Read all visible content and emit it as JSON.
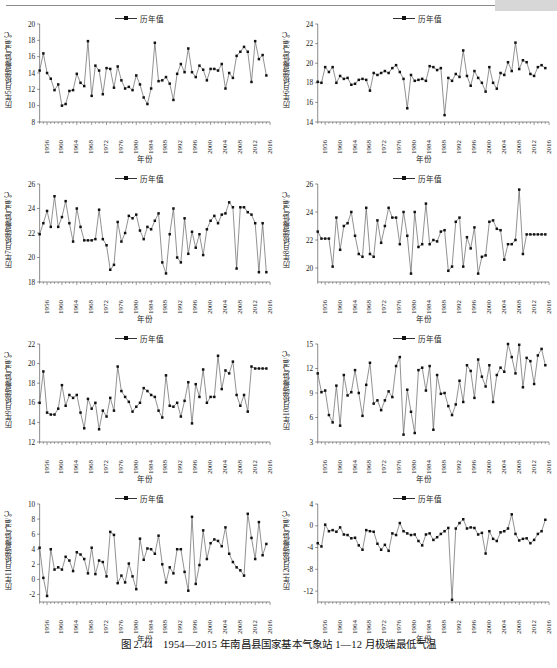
{
  "figure": {
    "caption": "图 2.44　1954—2015 年南昌县国家基本气象站 1—12 月极端最低气温",
    "legend_label": "历年值",
    "xaxis_title": "年份",
    "marker_color": "#111111",
    "line_color": "#555555"
  },
  "xticks": [
    "1956",
    "1960",
    "1964",
    "1968",
    "1972",
    "1976",
    "1980",
    "1984",
    "1988",
    "1992",
    "1996",
    "2000",
    "2004",
    "2008",
    "2012",
    "2016"
  ],
  "chart_data": [
    {
      "type": "line",
      "panel": 1,
      "title": "",
      "ylabel": "历年5月极端最低气温/℃",
      "xlabel": "年份",
      "series_name": "历年值",
      "ylim": [
        8,
        20
      ],
      "yticks": [
        8,
        10,
        12,
        14,
        16,
        18,
        20
      ],
      "grid": false,
      "legend_position": "top-center",
      "x": [
        1954,
        1955,
        1956,
        1957,
        1958,
        1959,
        1960,
        1961,
        1962,
        1963,
        1964,
        1965,
        1966,
        1967,
        1968,
        1969,
        1970,
        1971,
        1972,
        1973,
        1974,
        1975,
        1976,
        1977,
        1978,
        1979,
        1980,
        1981,
        1982,
        1983,
        1984,
        1985,
        1986,
        1987,
        1988,
        1989,
        1990,
        1991,
        1992,
        1993,
        1994,
        1995,
        1996,
        1997,
        1998,
        1999,
        2000,
        2001,
        2002,
        2003,
        2004,
        2005,
        2006,
        2007,
        2008,
        2009,
        2010,
        2011,
        2012,
        2013,
        2014,
        2015
      ],
      "values": [
        14.3,
        16.4,
        14.0,
        13.3,
        11.9,
        12.6,
        10.0,
        10.2,
        11.8,
        11.9,
        13.9,
        12.8,
        12.4,
        17.9,
        11.2,
        14.9,
        14.3,
        11.4,
        14.6,
        14.5,
        12.2,
        14.8,
        13.1,
        12.1,
        12.3,
        11.9,
        13.7,
        12.6,
        11.0,
        10.2,
        12.1,
        17.7,
        13.0,
        13.1,
        13.5,
        12.7,
        10.7,
        13.9,
        15.1,
        14.1,
        17.0,
        14.1,
        13.5,
        14.9,
        14.4,
        13.1,
        14.5,
        14.5,
        14.3,
        15.1,
        12.1,
        14.0,
        13.4,
        16.1,
        16.6,
        17.2,
        16.6,
        12.9,
        17.9,
        15.7,
        16.2,
        13.7
      ]
    },
    {
      "type": "line",
      "panel": 2,
      "title": "",
      "ylabel": "历年6月极端最低气温/℃",
      "xlabel": "年份",
      "series_name": "历年值",
      "ylim": [
        14,
        24
      ],
      "yticks": [
        14,
        16,
        18,
        20,
        22,
        24
      ],
      "grid": false,
      "legend_position": "top-center",
      "x": [
        1954,
        1955,
        1956,
        1957,
        1958,
        1959,
        1960,
        1961,
        1962,
        1963,
        1964,
        1965,
        1966,
        1967,
        1968,
        1969,
        1970,
        1971,
        1972,
        1973,
        1974,
        1975,
        1976,
        1977,
        1978,
        1979,
        1980,
        1981,
        1982,
        1983,
        1984,
        1985,
        1986,
        1987,
        1988,
        1989,
        1990,
        1991,
        1992,
        1993,
        1994,
        1995,
        1996,
        1997,
        1998,
        1999,
        2000,
        2001,
        2002,
        2003,
        2004,
        2005,
        2006,
        2007,
        2008,
        2009,
        2010,
        2011,
        2012,
        2013,
        2014,
        2015
      ],
      "values": [
        18.1,
        18.0,
        19.6,
        19.1,
        19.6,
        18.0,
        18.7,
        18.4,
        18.5,
        17.8,
        17.9,
        18.3,
        18.4,
        18.3,
        17.2,
        19.0,
        18.8,
        19.0,
        19.2,
        19.0,
        19.5,
        19.8,
        19.1,
        18.4,
        15.4,
        18.8,
        18.2,
        18.3,
        18.4,
        18.2,
        19.7,
        19.6,
        19.3,
        19.5,
        14.7,
        18.5,
        18.2,
        18.9,
        18.6,
        21.3,
        18.7,
        17.7,
        19.2,
        18.5,
        18.0,
        17.1,
        19.6,
        18.0,
        17.4,
        19.0,
        18.8,
        20.1,
        19.2,
        22.1,
        19.4,
        20.3,
        20.1,
        18.9,
        18.7,
        19.6,
        19.8,
        19.5
      ]
    },
    {
      "type": "line",
      "panel": 3,
      "title": "",
      "ylabel": "历年7月极端最低气温/℃",
      "xlabel": "年份",
      "series_name": "历年值",
      "ylim": [
        18,
        26
      ],
      "yticks": [
        18,
        20,
        22,
        24,
        26
      ],
      "grid": false,
      "legend_position": "top-center",
      "x": [
        1954,
        1955,
        1956,
        1957,
        1958,
        1959,
        1960,
        1961,
        1962,
        1963,
        1964,
        1965,
        1966,
        1967,
        1968,
        1969,
        1970,
        1971,
        1972,
        1973,
        1974,
        1975,
        1976,
        1977,
        1978,
        1979,
        1980,
        1981,
        1982,
        1983,
        1984,
        1985,
        1986,
        1987,
        1988,
        1989,
        1990,
        1991,
        1992,
        1993,
        1994,
        1995,
        1996,
        1997,
        1998,
        1999,
        2000,
        2001,
        2002,
        2003,
        2004,
        2005,
        2006,
        2007,
        2008,
        2009,
        2010,
        2011,
        2012,
        2013,
        2014,
        2015
      ],
      "values": [
        21.9,
        22.8,
        23.8,
        22.5,
        25.0,
        22.5,
        23.3,
        24.6,
        22.8,
        21.3,
        24.0,
        22.5,
        21.4,
        21.4,
        21.4,
        21.5,
        23.9,
        21.5,
        21.0,
        19.0,
        19.4,
        22.9,
        21.3,
        22.0,
        23.4,
        23.2,
        23.5,
        22.2,
        21.5,
        22.5,
        22.3,
        23.0,
        23.6,
        19.6,
        18.7,
        21.9,
        24.0,
        20.0,
        19.6,
        23.2,
        20.3,
        22.1,
        20.8,
        21.9,
        20.2,
        22.3,
        23.0,
        23.4,
        22.8,
        23.5,
        23.6,
        24.5,
        24.1,
        19.1,
        24.1,
        24.1,
        23.7,
        23.5,
        22.8,
        18.8,
        22.8,
        18.8
      ]
    },
    {
      "type": "line",
      "panel": 4,
      "title": "",
      "ylabel": "历年8月极端最低气温/℃",
      "xlabel": "年份",
      "series_name": "历年值",
      "ylim": [
        19,
        26
      ],
      "yticks": [
        20,
        22,
        24,
        26
      ],
      "grid": false,
      "legend_position": "top-center",
      "x": [
        1954,
        1955,
        1956,
        1957,
        1958,
        1959,
        1960,
        1961,
        1962,
        1963,
        1964,
        1965,
        1966,
        1967,
        1968,
        1969,
        1970,
        1971,
        1972,
        1973,
        1974,
        1975,
        1976,
        1977,
        1978,
        1979,
        1980,
        1981,
        1982,
        1983,
        1984,
        1985,
        1986,
        1987,
        1988,
        1989,
        1990,
        1991,
        1992,
        1993,
        1994,
        1995,
        1996,
        1997,
        1998,
        1999,
        2000,
        2001,
        2002,
        2003,
        2004,
        2005,
        2006,
        2007,
        2008,
        2009,
        2010,
        2011,
        2012,
        2013,
        2014,
        2015
      ],
      "values": [
        22.6,
        22.1,
        22.1,
        22.1,
        20.1,
        23.6,
        21.3,
        23.0,
        23.2,
        24.0,
        22.3,
        21.0,
        20.8,
        24.3,
        21.0,
        20.8,
        23.4,
        21.8,
        23.0,
        24.3,
        23.6,
        23.6,
        21.7,
        24.0,
        22.3,
        19.6,
        24.0,
        21.5,
        21.7,
        24.6,
        21.7,
        22.0,
        21.9,
        22.6,
        22.7,
        19.8,
        20.1,
        23.3,
        23.6,
        20.1,
        22.2,
        21.4,
        22.9,
        19.6,
        20.8,
        20.9,
        23.3,
        23.4,
        22.8,
        22.7,
        20.6,
        21.7,
        21.7,
        22.0,
        25.6,
        21.0,
        22.4,
        22.4,
        22.4,
        22.4,
        22.4,
        22.4
      ]
    },
    {
      "type": "line",
      "panel": 5,
      "title": "",
      "ylabel": "历年9月极端最低气温/℃",
      "xlabel": "年份",
      "series_name": "历年值",
      "ylim": [
        12,
        22
      ],
      "yticks": [
        12,
        14,
        16,
        18,
        20,
        22
      ],
      "grid": false,
      "legend_position": "top-center",
      "x": [
        1954,
        1955,
        1956,
        1957,
        1958,
        1959,
        1960,
        1961,
        1962,
        1963,
        1964,
        1965,
        1966,
        1967,
        1968,
        1969,
        1970,
        1971,
        1972,
        1973,
        1974,
        1975,
        1976,
        1977,
        1978,
        1979,
        1980,
        1981,
        1982,
        1983,
        1984,
        1985,
        1986,
        1987,
        1988,
        1989,
        1990,
        1991,
        1992,
        1993,
        1994,
        1995,
        1996,
        1997,
        1998,
        1999,
        2000,
        2001,
        2002,
        2003,
        2004,
        2005,
        2006,
        2007,
        2008,
        2009,
        2010,
        2011,
        2012,
        2013,
        2014,
        2015
      ],
      "values": [
        16.0,
        19.2,
        15.0,
        14.8,
        14.8,
        15.4,
        17.8,
        15.7,
        16.8,
        16.5,
        16.8,
        15.0,
        13.4,
        16.4,
        15.4,
        16.0,
        13.3,
        15.2,
        14.6,
        16.5,
        15.2,
        19.7,
        17.2,
        16.6,
        16.1,
        15.1,
        15.6,
        16.0,
        17.5,
        17.2,
        16.8,
        16.6,
        15.2,
        14.5,
        18.8,
        15.7,
        15.6,
        16.0,
        14.6,
        16.2,
        18.1,
        13.9,
        17.9,
        16.6,
        19.4,
        16.0,
        16.6,
        16.6,
        20.8,
        17.4,
        19.3,
        19.0,
        20.2,
        16.8,
        15.7,
        16.8,
        15.1,
        19.7,
        19.5,
        19.5,
        19.5,
        19.5
      ]
    },
    {
      "type": "line",
      "panel": 6,
      "title": "",
      "ylabel": "历年10月极端最低气温/℃",
      "xlabel": "年份",
      "series_name": "历年值",
      "ylim": [
        3,
        15
      ],
      "yticks": [
        3,
        6,
        9,
        12,
        15
      ],
      "grid": false,
      "legend_position": "top-center",
      "x": [
        1954,
        1955,
        1956,
        1957,
        1958,
        1959,
        1960,
        1961,
        1962,
        1963,
        1964,
        1965,
        1966,
        1967,
        1968,
        1969,
        1970,
        1971,
        1972,
        1973,
        1974,
        1975,
        1976,
        1977,
        1978,
        1979,
        1980,
        1981,
        1982,
        1983,
        1984,
        1985,
        1986,
        1987,
        1988,
        1989,
        1990,
        1991,
        1992,
        1993,
        1994,
        1995,
        1996,
        1997,
        1998,
        1999,
        2000,
        2001,
        2002,
        2003,
        2004,
        2005,
        2006,
        2007,
        2008,
        2009,
        2010,
        2011,
        2012,
        2013,
        2014,
        2015
      ],
      "values": [
        11.4,
        9.1,
        9.3,
        6.3,
        5.4,
        9.9,
        5.0,
        11.2,
        8.7,
        9.1,
        11.8,
        9.0,
        6.2,
        10.0,
        12.7,
        7.7,
        8.1,
        6.9,
        8.1,
        9.2,
        8.5,
        12.3,
        13.4,
        3.9,
        9.4,
        6.7,
        4.1,
        11.8,
        12.1,
        9.3,
        12.3,
        4.5,
        11.2,
        8.9,
        9.0,
        7.4,
        6.3,
        7.6,
        10.5,
        7.9,
        12.4,
        11.7,
        8.4,
        13.1,
        11.0,
        9.8,
        12.4,
        7.9,
        11.2,
        12.1,
        11.6,
        15.0,
        13.4,
        11.4,
        14.9,
        9.7,
        13.3,
        12.9,
        10.1,
        13.6,
        14.4,
        12.4
      ]
    },
    {
      "type": "line",
      "panel": 7,
      "title": "",
      "ylabel": "历年11月极端最低气温/℃",
      "xlabel": "年份",
      "series_name": "历年值",
      "ylim": [
        -3,
        10
      ],
      "yticks": [
        -2,
        0,
        2,
        4,
        6,
        8,
        10
      ],
      "grid": false,
      "legend_position": "top-center",
      "x": [
        1954,
        1955,
        1956,
        1957,
        1958,
        1959,
        1960,
        1961,
        1962,
        1963,
        1964,
        1965,
        1966,
        1967,
        1968,
        1969,
        1970,
        1971,
        1972,
        1973,
        1974,
        1975,
        1976,
        1977,
        1978,
        1979,
        1980,
        1981,
        1982,
        1983,
        1984,
        1985,
        1986,
        1987,
        1988,
        1989,
        1990,
        1991,
        1992,
        1993,
        1994,
        1995,
        1996,
        1997,
        1998,
        1999,
        2000,
        2001,
        2002,
        2003,
        2004,
        2005,
        2006,
        2007,
        2008,
        2009,
        2010,
        2011,
        2012,
        2013,
        2014,
        2015
      ],
      "values": [
        4.2,
        0.2,
        -2.2,
        4.0,
        1.3,
        1.6,
        1.3,
        3.0,
        2.5,
        1.1,
        3.6,
        3.3,
        2.7,
        0.8,
        4.2,
        0.7,
        2.5,
        2.3,
        0.4,
        6.3,
        5.9,
        -0.5,
        0.5,
        -0.4,
        2.1,
        0.4,
        -1.3,
        5.4,
        2.6,
        4.1,
        4.0,
        3.4,
        5.8,
        2.0,
        -0.4,
        1.6,
        0.8,
        4.0,
        4.0,
        1.0,
        -1.5,
        8.3,
        -0.6,
        1.9,
        6.5,
        2.7,
        4.8,
        5.3,
        5.1,
        4.4,
        6.9,
        3.4,
        2.3,
        1.6,
        1.2,
        0.5,
        8.7,
        5.5,
        2.7,
        7.6,
        3.2,
        4.7
      ]
    },
    {
      "type": "line",
      "panel": 8,
      "title": "",
      "ylabel": "历年12月极端最低气温/℃",
      "xlabel": "年份",
      "series_name": "历年值",
      "ylim": [
        -14,
        4
      ],
      "yticks": [
        -12,
        -8,
        -4,
        0,
        4
      ],
      "grid": false,
      "legend_position": "top-center",
      "x": [
        1954,
        1955,
        1956,
        1957,
        1958,
        1959,
        1960,
        1961,
        1962,
        1963,
        1964,
        1965,
        1966,
        1967,
        1968,
        1969,
        1970,
        1971,
        1972,
        1973,
        1974,
        1975,
        1976,
        1977,
        1978,
        1979,
        1980,
        1981,
        1982,
        1983,
        1984,
        1985,
        1986,
        1987,
        1988,
        1989,
        1990,
        1991,
        1992,
        1993,
        1994,
        1995,
        1996,
        1997,
        1998,
        1999,
        2000,
        2001,
        2002,
        2003,
        2004,
        2005,
        2006,
        2007,
        2008,
        2009,
        2010,
        2011,
        2012,
        2013,
        2014,
        2015
      ],
      "values": [
        -3.2,
        -3.8,
        0.2,
        -1.0,
        -0.8,
        -1.1,
        -0.3,
        -1.6,
        -1.7,
        -2.3,
        -2.2,
        -3.6,
        -4.4,
        -0.8,
        -1.0,
        -1.1,
        -3.3,
        -4.4,
        -3.5,
        -4.6,
        -1.4,
        -1.7,
        0.5,
        -1.0,
        -1.4,
        -1.7,
        -1.6,
        -2.8,
        -3.6,
        -1.6,
        -1.4,
        -2.6,
        -2.1,
        -1.5,
        -1.0,
        -0.4,
        -13.6,
        -0.5,
        0.5,
        1.2,
        -0.5,
        -0.3,
        -0.4,
        -1.6,
        -1.3,
        -5.1,
        -1.0,
        -2.4,
        -2.8,
        -1.2,
        -1.0,
        -0.5,
        2.1,
        -1.5,
        -2.7,
        -2.4,
        -2.3,
        -3.2,
        -2.6,
        -1.5,
        -1.0,
        1.1
      ]
    }
  ]
}
